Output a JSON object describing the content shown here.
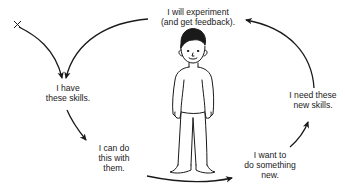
{
  "diagram": {
    "type": "cycle",
    "start_marker": "X",
    "colors": {
      "ink": "#1a1a1a",
      "background": "#ffffff"
    },
    "nodes": [
      {
        "id": "have_skills",
        "lines": [
          "I have",
          "these skills."
        ]
      },
      {
        "id": "can_do",
        "lines": [
          "I can do",
          "this with",
          "them."
        ]
      },
      {
        "id": "want_new",
        "lines": [
          "I want to",
          "do something",
          "new."
        ]
      },
      {
        "id": "need_skills",
        "lines": [
          "I need these",
          "new skills."
        ]
      },
      {
        "id": "experiment",
        "lines": [
          "I will experiment",
          "(and get feedback)."
        ]
      }
    ],
    "edges": [
      {
        "from": "start",
        "to": "have_skills"
      },
      {
        "from": "have_skills",
        "to": "can_do"
      },
      {
        "from": "can_do",
        "to": "want_new"
      },
      {
        "from": "want_new",
        "to": "need_skills"
      },
      {
        "from": "need_skills",
        "to": "experiment"
      },
      {
        "from": "experiment",
        "to": "have_skills"
      }
    ],
    "center_figure": "person-illustration"
  }
}
